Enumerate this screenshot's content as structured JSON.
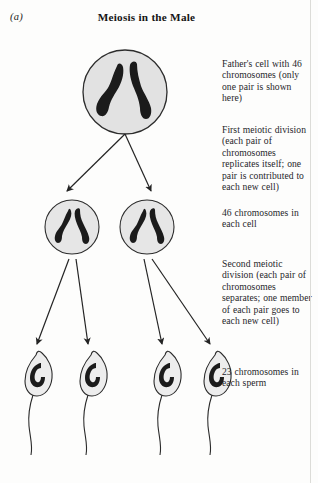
{
  "figure": {
    "panel_label": "(a)",
    "title": "Meiosis in the Male",
    "type": "biology-diagram"
  },
  "captions": {
    "father_cell": "Father's cell with 46 chromosomes (only one pair is shown here)",
    "first_division": "First meiotic division (each pair of chromosomes replicates itself; one pair is contributed to each new cell)",
    "forty_six": "46 chromosomes in each cell",
    "second_division": "Second meiotic division (each pair of chromosomes separates; one member of each pair goes to each new cell)",
    "twenty_three": "23 chromosomes in each sperm"
  },
  "diagram": {
    "parent_cell": {
      "name": "father-cell",
      "cx": 125,
      "cy": 92,
      "r": 42,
      "chromosome_count": 2,
      "fill": "#e2e2e2",
      "stroke": "#2c2c2c"
    },
    "daughter_cells": [
      {
        "name": "daughter-cell-left",
        "cx": 72,
        "cy": 227,
        "r": 27,
        "chromosome_count": 2
      },
      {
        "name": "daughter-cell-right",
        "cx": 147,
        "cy": 227,
        "r": 27,
        "chromosome_count": 2
      }
    ],
    "sperm_cells": [
      {
        "name": "sperm-1",
        "x": 33,
        "y": 372,
        "chromosome_count": 1
      },
      {
        "name": "sperm-2",
        "x": 88,
        "y": 372,
        "chromosome_count": 1
      },
      {
        "name": "sperm-3",
        "x": 162,
        "y": 372,
        "chromosome_count": 1
      },
      {
        "name": "sperm-4",
        "x": 212,
        "y": 372,
        "chromosome_count": 1
      }
    ],
    "arrow_groups": [
      {
        "name": "first-division-arrows",
        "from": [
          125,
          133
        ],
        "to": [
          [
            66,
            192
          ],
          [
            152,
            192
          ]
        ]
      },
      {
        "name": "second-division-arrows-left",
        "from": [
          72,
          262
        ],
        "to": [
          [
            36,
            345
          ],
          [
            88,
            345
          ]
        ]
      },
      {
        "name": "second-division-arrows-right",
        "from": [
          147,
          262
        ],
        "to": [
          [
            160,
            345
          ],
          [
            212,
            345
          ]
        ]
      }
    ],
    "colors": {
      "cell_fill": "#e2e2e2",
      "cell_stroke": "#2c2c2c",
      "chromosome": "#1b1b1b",
      "sperm_head_fill": "#ededed",
      "arrow": "#242424",
      "page_background": "#fdfdfc"
    }
  }
}
